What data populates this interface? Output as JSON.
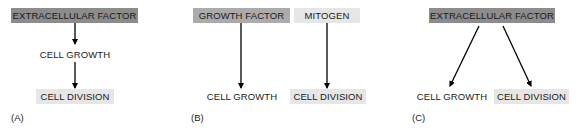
{
  "panels": [
    {
      "label": "(A)",
      "source": "EXTRACELLULAR FACTOR",
      "middle": "CELL GROWTH",
      "target": "CELL DIVISION"
    },
    {
      "label": "(B)",
      "sources": [
        "GROWTH FACTOR",
        "MITOGEN"
      ],
      "targets": [
        "CELL GROWTH",
        "CELL DIVISION"
      ]
    },
    {
      "label": "(C)",
      "source": "EXTRACELLULAR FACTOR",
      "targets": [
        "CELL GROWTH",
        "CELL DIVISION"
      ]
    }
  ],
  "colors": {
    "extracellular_factor_box": "#8c8c8c",
    "growth_factor_box": "#ababab",
    "light_box": "#e6e6e6",
    "arrow": "#000000"
  }
}
